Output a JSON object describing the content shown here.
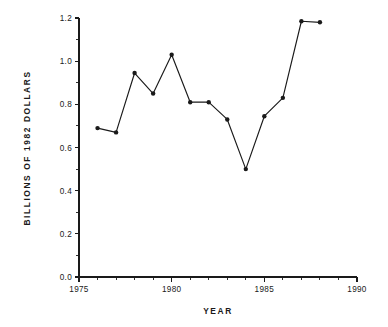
{
  "chart_data": {
    "type": "line",
    "title": "",
    "xlabel": "YEAR",
    "ylabel": "BILLIONS OF 1982 DOLLARS",
    "xlim": [
      1975,
      1990
    ],
    "ylim": [
      0.0,
      1.2
    ],
    "grid": false,
    "legend": false,
    "marker": "filled-circle",
    "line_color": "#1a1a1a",
    "x": [
      1976,
      1977,
      1978,
      1979,
      1980,
      1981,
      1982,
      1983,
      1984,
      1985,
      1986,
      1987,
      1988
    ],
    "values": [
      0.69,
      0.67,
      0.945,
      0.85,
      1.03,
      0.81,
      0.81,
      0.73,
      0.5,
      0.745,
      0.83,
      1.185,
      1.18
    ],
    "xticks": [
      1975,
      1980,
      1985,
      1990
    ],
    "xticklabels": [
      "1975",
      "1980",
      "1985",
      "1990"
    ],
    "xminorticks": [
      1976,
      1977,
      1978,
      1979,
      1981,
      1982,
      1983,
      1984,
      1986,
      1987,
      1988,
      1989
    ],
    "yticks": [
      0.0,
      0.2,
      0.4,
      0.6,
      0.8,
      1.0,
      1.2
    ],
    "yticklabels": [
      "0.0",
      "0.2",
      "0.4",
      "0.6",
      "0.8",
      "1.0",
      "1.2"
    ],
    "yminorticks": [
      0.1,
      0.3,
      0.5,
      0.7,
      0.9,
      1.1
    ]
  }
}
